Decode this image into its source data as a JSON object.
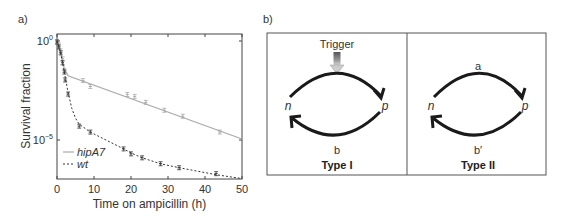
{
  "panels": {
    "a": {
      "label": "a)"
    },
    "b": {
      "label": "b)"
    }
  },
  "chart_data": {
    "type": "line",
    "title": "",
    "xlabel": "Time on ampicillin (h)",
    "ylabel": "Survival fraction",
    "xlim": [
      0,
      50
    ],
    "ylim_log10": [
      -7,
      0.35
    ],
    "yscale": "log",
    "x_ticks": [
      0,
      10,
      20,
      30,
      40,
      50
    ],
    "y_ticks": [
      {
        "log10": 0,
        "label_base": "10",
        "label_exp": "0"
      },
      {
        "log10": -5,
        "label_base": "10",
        "label_exp": "−5"
      }
    ],
    "grid": false,
    "legend": {
      "position": "lower-left",
      "entries": [
        "hipA7",
        "wt"
      ]
    },
    "series": [
      {
        "name": "hipA7",
        "style": "solid",
        "color": "#aaaaaa",
        "fit_line_log10": [
          [
            0,
            0
          ],
          [
            0.5,
            -0.3
          ],
          [
            1,
            -0.6
          ],
          [
            1.5,
            -1.0
          ],
          [
            2,
            -1.4
          ],
          [
            3,
            -1.75
          ],
          [
            50,
            -4.95
          ]
        ],
        "points_log10": [
          [
            0,
            -0.05
          ],
          [
            0.5,
            -0.2
          ],
          [
            1,
            -0.5
          ],
          [
            1.5,
            -0.9
          ],
          [
            2,
            -1.5
          ],
          [
            7,
            -2.0
          ],
          [
            9,
            -2.3
          ],
          [
            19,
            -2.7
          ],
          [
            21,
            -2.8
          ],
          [
            24,
            -3.1
          ],
          [
            29,
            -3.5
          ],
          [
            34,
            -3.8
          ],
          [
            44,
            -4.6
          ]
        ]
      },
      {
        "name": "wt",
        "style": "dashed",
        "color": "#333333",
        "fit_line_log10": [
          [
            0,
            0
          ],
          [
            1,
            -0.6
          ],
          [
            2,
            -1.6
          ],
          [
            3,
            -2.6
          ],
          [
            4,
            -3.4
          ],
          [
            5,
            -3.9
          ],
          [
            6,
            -4.2
          ],
          [
            9,
            -4.6
          ],
          [
            18,
            -5.45
          ],
          [
            20,
            -5.65
          ],
          [
            23,
            -5.9
          ],
          [
            28,
            -6.2
          ],
          [
            33,
            -6.4
          ],
          [
            43,
            -6.75
          ],
          [
            50,
            -6.95
          ]
        ],
        "points_log10": [
          [
            0,
            -0.05
          ],
          [
            0.5,
            -0.3
          ],
          [
            1,
            -0.6
          ],
          [
            1.5,
            -1.1
          ],
          [
            2,
            -1.57
          ],
          [
            2.2,
            -1.97
          ],
          [
            3,
            -2.68
          ],
          [
            6,
            -4.3
          ],
          [
            9,
            -4.6
          ],
          [
            18,
            -5.45
          ],
          [
            20,
            -5.7
          ],
          [
            23,
            -5.9
          ],
          [
            28,
            -6.2
          ],
          [
            33,
            -6.4
          ],
          [
            43,
            -6.7
          ]
        ]
      }
    ]
  },
  "diagram": {
    "type_i": {
      "title": "Type I",
      "trigger_label": "Trigger",
      "node_left": "n",
      "node_right": "p",
      "bottom_label": "b"
    },
    "type_ii": {
      "title": "Type II",
      "top_label": "a",
      "node_left": "n",
      "node_right": "p",
      "bottom_label": "b′"
    }
  }
}
